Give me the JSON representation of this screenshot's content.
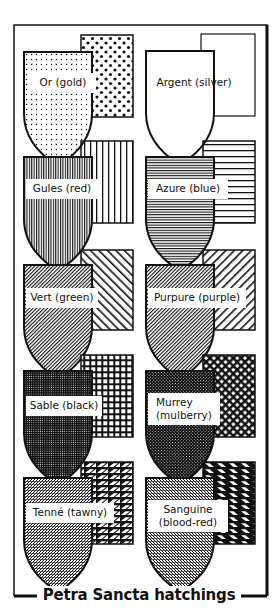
{
  "title": "Petra Sancta hatchings",
  "tinctures": [
    {
      "name": "Or (gold)",
      "pattern": "dots",
      "row": 0,
      "col": 0
    },
    {
      "name": "Argent (silver)",
      "pattern": "plain",
      "row": 0,
      "col": 1
    },
    {
      "name": "Gules (red)",
      "pattern": "vertical-lines",
      "row": 1,
      "col": 0
    },
    {
      "name": "Azure (blue)",
      "pattern": "horizontal-lines",
      "row": 1,
      "col": 1
    },
    {
      "name": "Vert (green)",
      "pattern": "diagonal-dexter",
      "row": 2,
      "col": 0
    },
    {
      "name": "Purpure (purple)",
      "pattern": "diagonal-sinister",
      "row": 2,
      "col": 1
    },
    {
      "name": "Sable (black)",
      "pattern": "grid",
      "row": 3,
      "col": 0
    },
    {
      "name": "Murrey\n(mulberry)",
      "pattern": "diagonal-cross",
      "row": 3,
      "col": 1
    },
    {
      "name": "Tenné (tawny)",
      "pattern": "diagonal-brick-sinister",
      "row": 4,
      "col": 0
    },
    {
      "name": "Sanguine\n(blood-red)",
      "pattern": "diagonal-brick-dexter",
      "row": 4,
      "col": 1
    }
  ],
  "colors": {
    "ink": "#111111",
    "paper": "#ffffff"
  }
}
